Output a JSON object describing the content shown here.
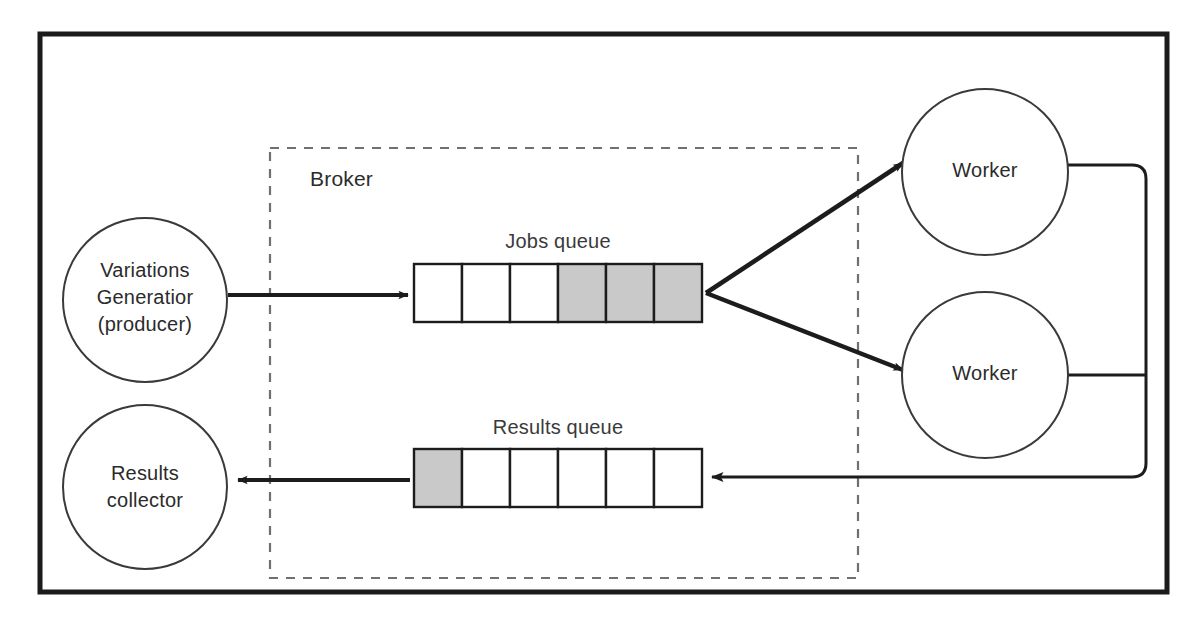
{
  "diagram": {
    "frame": {
      "name": "outer-frame",
      "stroke": "#1a1a1a",
      "fill": "#ffffff"
    },
    "broker": {
      "label": "Broker",
      "stroke": "#6f6f6f",
      "style": "dashed"
    },
    "nodes": [
      {
        "id": "producer",
        "lines": [
          "Variations",
          "Generatior",
          "(producer)"
        ],
        "shape": "circle",
        "cx": 145,
        "cy": 300,
        "r": 82
      },
      {
        "id": "collector",
        "lines": [
          "Results",
          "collector"
        ],
        "shape": "circle",
        "cx": 145,
        "cy": 487,
        "r": 82
      },
      {
        "id": "worker-top",
        "lines": [
          "Worker"
        ],
        "shape": "circle",
        "cx": 985,
        "cy": 172,
        "r": 83
      },
      {
        "id": "worker-bottom",
        "lines": [
          "Worker"
        ],
        "shape": "circle",
        "cx": 985,
        "cy": 375,
        "r": 83
      }
    ],
    "queues": [
      {
        "id": "jobs-queue",
        "label": "Jobs queue",
        "x": 414,
        "y": 264,
        "cell_width": 48,
        "cell_height": 58,
        "cells": [
          "empty",
          "empty",
          "empty",
          "filled",
          "filled",
          "filled"
        ],
        "filled_color": "#c9c9c9",
        "empty_color": "#ffffff"
      },
      {
        "id": "results-queue",
        "label": "Results queue",
        "x": 414,
        "y": 449,
        "cell_width": 48,
        "cell_height": 58,
        "cells": [
          "filled",
          "empty",
          "empty",
          "empty",
          "empty",
          "empty"
        ],
        "filled_color": "#c9c9c9",
        "empty_color": "#ffffff"
      }
    ],
    "connections": [
      {
        "id": "producer-to-jobs-queue",
        "from": "producer",
        "to": "jobs-queue",
        "arrow": true
      },
      {
        "id": "jobs-queue-to-worker-top",
        "from": "jobs-queue",
        "to": "worker-top",
        "arrow": true
      },
      {
        "id": "jobs-queue-to-worker-bottom",
        "from": "jobs-queue",
        "to": "worker-bottom",
        "arrow": true
      },
      {
        "id": "worker-top-return",
        "from": "worker-top",
        "to": "results-queue",
        "arrow": true
      },
      {
        "id": "worker-bottom-return",
        "from": "worker-bottom",
        "to": "results-queue",
        "arrow": true
      },
      {
        "id": "results-queue-to-collector",
        "from": "results-queue",
        "to": "collector",
        "arrow": true
      }
    ]
  }
}
